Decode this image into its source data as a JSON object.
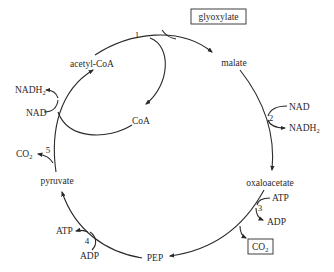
{
  "diagram": {
    "nodes": {
      "glyoxylate": "glyoxylate",
      "malate": "malate",
      "acetyl_coa": "acetyl-CoA",
      "coa": "CoA",
      "oxaloacetate": "oxaloacetate",
      "pep": "PEP",
      "pyruvate": "pyruvate"
    },
    "steps": {
      "step1": "1",
      "step2": "2",
      "step3": "3",
      "step4": "4",
      "step5": "5"
    },
    "cofactors": {
      "step2_in": "NAD",
      "step2_out_main": "NADH",
      "step2_out_sub": "2",
      "step3_in": "ATP",
      "step3_out": "ADP",
      "step3_co2_main": "CO",
      "step3_co2_sub": "2",
      "step4_in": "ADP",
      "step4_out": "ATP",
      "step5_co2_main": "CO",
      "step5_co2_sub": "2",
      "nad_in": "NAD",
      "nadh_out_main": "NADH",
      "nadh_out_sub": "2"
    }
  }
}
